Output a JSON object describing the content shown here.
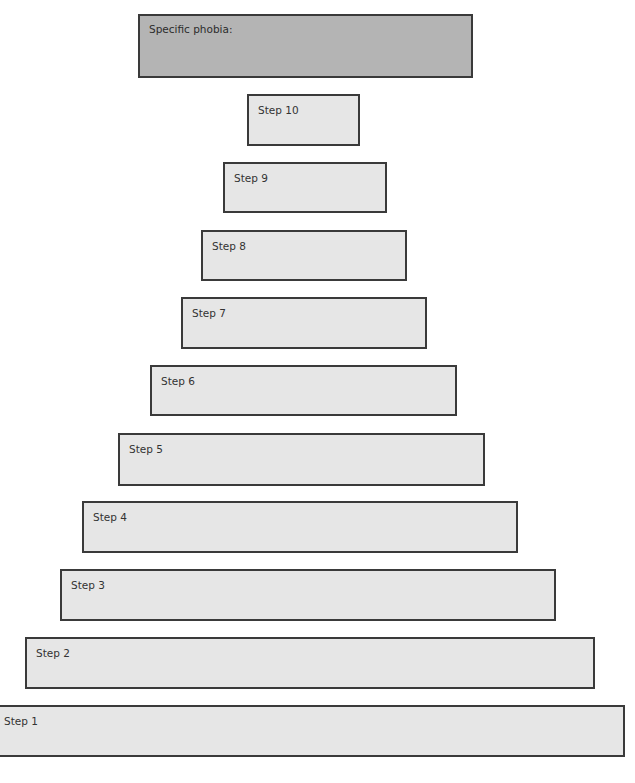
{
  "diagram": {
    "type": "fear-hierarchy-ladder",
    "title": "Specific phobia:",
    "colors": {
      "title_fill": "#b4b4b4",
      "step_fill": "#e6e6e6",
      "border": "#3a3a3a"
    },
    "steps": [
      {
        "label": "Step 10"
      },
      {
        "label": "Step 9"
      },
      {
        "label": "Step 8"
      },
      {
        "label": "Step 7"
      },
      {
        "label": "Step 6"
      },
      {
        "label": "Step 5"
      },
      {
        "label": "Step 4"
      },
      {
        "label": "Step 3"
      },
      {
        "label": "Step 2"
      },
      {
        "label": "Step 1"
      }
    ]
  }
}
